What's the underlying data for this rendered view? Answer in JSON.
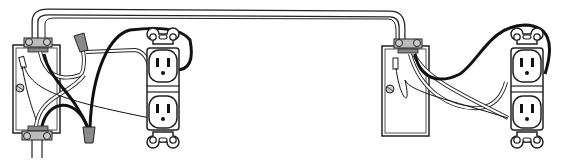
{
  "diagram": {
    "title": "",
    "colors": {
      "line": "#222222",
      "hot_wire": "#111111",
      "neutral_wire": "#ffffff",
      "wire_nut": "#8a8a8a",
      "clamp": "#9a9a9a",
      "background": "#ffffff"
    },
    "components": [
      {
        "id": "box-left",
        "type": "electrical-box"
      },
      {
        "id": "receptacle-left",
        "type": "duplex-receptacle"
      },
      {
        "id": "wire-nut-top",
        "type": "wire-nut"
      },
      {
        "id": "wire-nut-bottom",
        "type": "wire-nut"
      },
      {
        "id": "cable-run",
        "type": "cable"
      },
      {
        "id": "box-right",
        "type": "electrical-box"
      },
      {
        "id": "receptacle-right",
        "type": "duplex-receptacle"
      }
    ]
  }
}
